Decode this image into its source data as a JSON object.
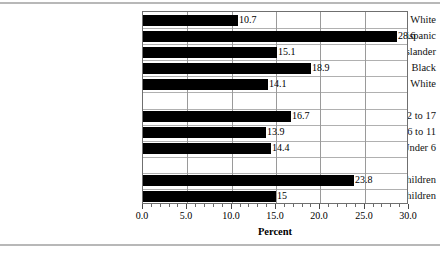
{
  "chart_data": {
    "type": "bar",
    "orientation": "horizontal",
    "title": "",
    "xlabel": "Percent",
    "ylabel": "",
    "xlim": [
      0.0,
      30.0
    ],
    "xticks": [
      "0.0",
      "5.0",
      "10.0",
      "15.0",
      "20.0",
      "25.0",
      "30.0"
    ],
    "xtick_values": [
      0,
      5,
      10,
      15,
      20,
      25,
      30
    ],
    "grid": "vertical-and-horizontal",
    "legend": "none",
    "categories": [
      "Non-Hispanic White",
      "Hispanic",
      "Asian or Pacific Islander",
      "Black",
      "White",
      "12 to 17",
      "6 to 11",
      "Under 6",
      "Poor Children",
      "All Children"
    ],
    "values": [
      10.7,
      28.6,
      15.1,
      18.9,
      14.1,
      16.7,
      13.9,
      14.4,
      23.8,
      15
    ],
    "value_labels": [
      "10.7",
      "28.6",
      "15.1",
      "18.9",
      "14.1",
      "16.7",
      "13.9",
      "14.4",
      "23.8",
      "15"
    ],
    "groups": [
      {
        "name": "race-ethnicity",
        "categories": [
          "Non-Hispanic White",
          "Hispanic",
          "Asian or Pacific Islander",
          "Black",
          "White"
        ]
      },
      {
        "name": "age",
        "categories": [
          "12 to 17",
          "6 to 11",
          "Under 6"
        ]
      },
      {
        "name": "overall",
        "categories": [
          "Poor Children",
          "All Children"
        ]
      }
    ],
    "bar_color": "#000000",
    "background_color": "#ffffff"
  }
}
